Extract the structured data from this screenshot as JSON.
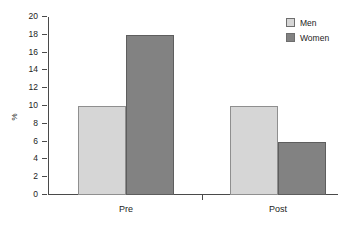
{
  "chart_data": {
    "type": "bar",
    "title": "",
    "subtitle": "",
    "xlabel": "",
    "ylabel": "%",
    "categories": [
      "Pre",
      "Post"
    ],
    "series": [
      {
        "name": "Men",
        "values": [
          10,
          10
        ],
        "color": "#d6d6d6"
      },
      {
        "name": "Women",
        "values": [
          18,
          6
        ],
        "color": "#828282"
      }
    ],
    "ylim": [
      0,
      20
    ],
    "ytick_interval": 2,
    "yticks": [
      0,
      2,
      4,
      6,
      8,
      10,
      12,
      14,
      16,
      18,
      20
    ],
    "ytick_labels": [
      "0",
      "2",
      "4",
      "6",
      "8",
      "10",
      "12",
      "14",
      "16",
      "18",
      "20"
    ],
    "grid": false,
    "legend_position": "top-right",
    "bar_grouping": "clustered-adjacent"
  },
  "legend": {
    "items": [
      {
        "label": "Men",
        "swatch": "legend-swatch-men"
      },
      {
        "label": "Women",
        "swatch": "legend-swatch-women"
      }
    ]
  },
  "axes": {
    "y_title": "%",
    "x_categories": [
      "Pre",
      "Post"
    ]
  }
}
